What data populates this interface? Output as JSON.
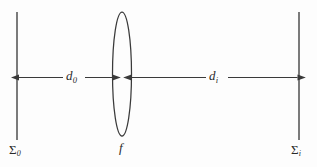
{
  "figure": {
    "type": "optical-ray-diagram",
    "background_color": "#fdfdfd",
    "stroke_color": "#3a3a3a"
  },
  "planes": {
    "object_plane": {
      "name": "object-plane",
      "label_main": "Σ",
      "label_sub": "0",
      "x": 17,
      "y_top": 12,
      "y_bottom": 140
    },
    "image_plane": {
      "name": "image-plane",
      "label_main": "Σ",
      "label_sub": "i",
      "x": 299,
      "y_top": 12,
      "y_bottom": 140
    }
  },
  "lens": {
    "name": "converging-lens",
    "label": "f",
    "center_x": 122,
    "center_y": 74,
    "rx": 9,
    "ry": 62
  },
  "dimensions": {
    "object_distance": {
      "label_main": "d",
      "label_sub": "0",
      "from": "object-plane",
      "to": "lens",
      "axis_y": 77,
      "x_start": 18,
      "x_end": 113
    },
    "image_distance": {
      "label_main": "d",
      "label_sub": "i",
      "from": "lens",
      "to": "image-plane",
      "axis_y": 77,
      "x_start": 131,
      "x_end": 298
    }
  }
}
